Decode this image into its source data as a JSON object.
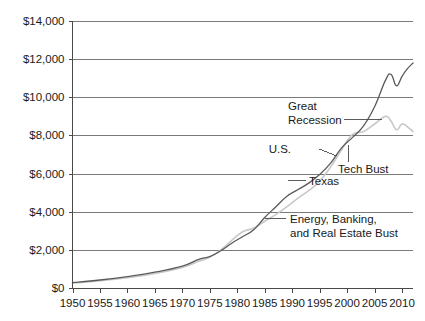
{
  "chart_data": {
    "type": "line",
    "title": "",
    "subtitle": "",
    "xlabel": "",
    "ylabel": "",
    "xlim": [
      1950,
      2012
    ],
    "ylim": [
      0,
      14000
    ],
    "y_tick_labels": [
      "$0",
      "$2,000",
      "$4,000",
      "$6,000",
      "$8,000",
      "$10,000",
      "$12,000",
      "$14,000"
    ],
    "y_tick_values": [
      0,
      2000,
      4000,
      6000,
      8000,
      10000,
      12000,
      14000
    ],
    "x_tick_labels": [
      "1950",
      "1955",
      "1960",
      "1965",
      "1970",
      "1975",
      "1980",
      "1985",
      "1990",
      "1995",
      "2000",
      "2005",
      "2010"
    ],
    "x_tick_values": [
      1950,
      1955,
      1960,
      1965,
      1970,
      1975,
      1980,
      1985,
      1990,
      1995,
      2000,
      2005,
      2010
    ],
    "grid": true,
    "legend_position": "inline-annotations",
    "colors": {
      "us_line": "#5a5a5a",
      "texas_line": "#c8c8c8",
      "gridline": "#7a7a7a",
      "axis": "#4a4a4a",
      "text": "#1a1a1a",
      "background": "#ffffff"
    },
    "series": [
      {
        "name": "U.S.",
        "color": "#5a5a5a",
        "x": [
          1950,
          1955,
          1960,
          1965,
          1970,
          1973,
          1975,
          1977,
          1979,
          1981,
          1983,
          1985,
          1987,
          1989,
          1991,
          1993,
          1995,
          1997,
          1999,
          2001,
          2003,
          2005,
          2007,
          2008,
          2009,
          2010,
          2011,
          2012
        ],
        "values": [
          280,
          420,
          600,
          830,
          1150,
          1500,
          1650,
          1950,
          2350,
          2700,
          3050,
          3700,
          4250,
          4800,
          5150,
          5500,
          5950,
          6550,
          7350,
          7900,
          8500,
          9500,
          10900,
          11200,
          10600,
          11100,
          11500,
          11800
        ]
      },
      {
        "name": "Texas",
        "color": "#c8c8c8",
        "x": [
          1950,
          1955,
          1960,
          1965,
          1970,
          1973,
          1975,
          1977,
          1979,
          1981,
          1983,
          1985,
          1987,
          1989,
          1991,
          1993,
          1995,
          1997,
          1999,
          2001,
          2003,
          2005,
          2007,
          2008,
          2009,
          2010,
          2011,
          2012
        ],
        "values": [
          250,
          380,
          540,
          760,
          1080,
          1400,
          1620,
          2000,
          2500,
          2950,
          3150,
          3500,
          3850,
          4250,
          4700,
          5100,
          5600,
          6350,
          7250,
          8050,
          8200,
          8600,
          9000,
          8750,
          8300,
          8600,
          8450,
          8200
        ]
      }
    ],
    "annotations": [
      {
        "id": "great-recession",
        "text_lines": [
          "Great",
          "Recession"
        ],
        "has_leader": true,
        "leader": "horizontal-right"
      },
      {
        "id": "us-label",
        "text_lines": [
          "U.S."
        ],
        "has_leader": true,
        "leader": "short-right-down"
      },
      {
        "id": "tech-bust",
        "text_lines": [
          "Tech Bust"
        ],
        "has_leader": true,
        "leader": "vertical-up"
      },
      {
        "id": "texas-label",
        "text_lines": [
          "Texas"
        ],
        "has_leader": true,
        "leader": "horizontal-left"
      },
      {
        "id": "energy-banking-bust",
        "text_lines": [
          "Energy, Banking,",
          "and Real Estate Bust"
        ],
        "has_leader": true,
        "leader": "horizontal-left"
      }
    ]
  },
  "annotation_text": {
    "great_recession_line1": "Great",
    "great_recession_line2": "Recession",
    "us": "U.S.",
    "tech_bust": "Tech Bust",
    "texas": "Texas",
    "energy_line1": "Energy, Banking,",
    "energy_line2": "and Real Estate Bust"
  },
  "axis_labels": {
    "y": [
      "$0",
      "$2,000",
      "$4,000",
      "$6,000",
      "$8,000",
      "$10,000",
      "$12,000",
      "$14,000"
    ],
    "x": [
      "1950",
      "1955",
      "1960",
      "1965",
      "1970",
      "1975",
      "1980",
      "1985",
      "1990",
      "1995",
      "2000",
      "2005",
      "2010"
    ]
  }
}
